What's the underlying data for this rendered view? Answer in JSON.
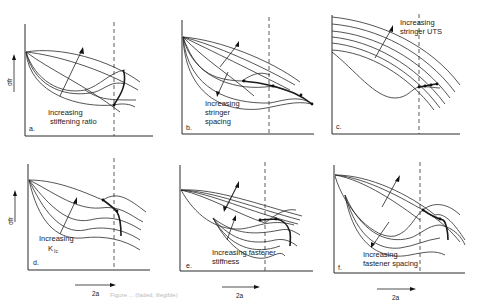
{
  "figure": {
    "y_axis_label": "σfr",
    "x_axis_label": "2a",
    "caption": "Figure ... (faded, illegible)",
    "panels": [
      {
        "id": "a",
        "label": "a.",
        "annotation_line1": "Increasing",
        "annotation_line2": "stiffening ratio"
      },
      {
        "id": "b",
        "label": "b.",
        "annotation_line1": "Increasing",
        "annotation_line2": "stringer",
        "annotation_line3": "spacing"
      },
      {
        "id": "c",
        "label": "c.",
        "annotation_line1": "Increasing",
        "annotation_line2": "stringer UTS"
      },
      {
        "id": "d",
        "label": "d.",
        "annotation_line1": "Increasing",
        "annotation_line2": "K",
        "annotation_sub": "Ic"
      },
      {
        "id": "e",
        "label": "e.",
        "annotation_line1": "Increasing fastener",
        "annotation_line2": "stiffness"
      },
      {
        "id": "f",
        "label": "f.",
        "annotation_line1": "Increasing",
        "annotation_line2": "fastener spacing"
      }
    ]
  }
}
